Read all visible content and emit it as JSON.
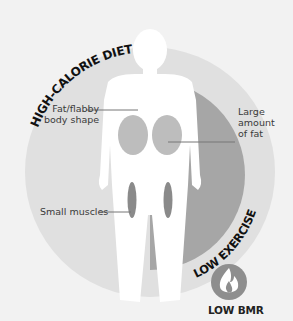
{
  "diagram": {
    "arc_labels": {
      "outer": "HIGH-CALORIE DIET",
      "inner": "LOW EXERCISE"
    },
    "annotations": [
      {
        "id": "fat-body",
        "text_line1": "Fat/flabby",
        "text_line2": "body shape"
      },
      {
        "id": "large-fat",
        "text_line1": "Large",
        "text_line2": "amount",
        "text_line3": "of fat"
      },
      {
        "id": "small-muscles",
        "text_line1": "Small muscles"
      }
    ],
    "badge": {
      "icon": "flame-icon",
      "label": "LOW BMR"
    },
    "colors": {
      "background": "#f2f2f2",
      "outer_circle": "#e0e0e0",
      "inner_arc": "#a6a6a6",
      "body": "#ffffff",
      "fat": "#bdbdbd",
      "muscle": "#8a8a8a",
      "badge": "#8e8e8e",
      "text": "#222222"
    }
  }
}
